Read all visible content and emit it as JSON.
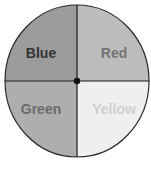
{
  "spinner": {
    "sections": [
      {
        "label": "Blue",
        "fill": "#9c9c9c",
        "text_color": "#333333"
      },
      {
        "label": "Red",
        "fill": "#bdbdbd",
        "text_color": "#737373"
      },
      {
        "label": "Green",
        "fill": "#aeaeae",
        "text_color": "#6b6b6b"
      },
      {
        "label": "Yellow",
        "fill": "#efefef",
        "text_color": "#cfcfcf"
      }
    ],
    "outline_color": "#2a2a2a",
    "center_dot_color": "#111111"
  },
  "caption": {
    "left": "",
    "right": ""
  }
}
